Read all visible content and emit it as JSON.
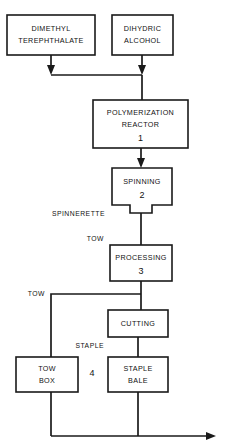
{
  "diagram": {
    "type": "process-flow-chart",
    "background_color": "#ffffff",
    "line_color": "#1a1a1a",
    "text_color": "#111111",
    "nodes": [
      {
        "id": "dimethyl-terephthalate",
        "shape": "rect",
        "line1": "DIMETHYL",
        "line2": "TEREPHTHALATE",
        "number": "",
        "x": 7,
        "y": 15,
        "w": 88,
        "h": 40
      },
      {
        "id": "dihydric-alcohol",
        "shape": "rect",
        "line1": "DIHYDRIC",
        "line2": "ALCOHOL",
        "number": "",
        "x": 112,
        "y": 15,
        "w": 61,
        "h": 40
      },
      {
        "id": "polymerization-reactor",
        "shape": "rect",
        "line1": "POLYMERIZATION",
        "line2": "REACTOR",
        "number": "1",
        "x": 93,
        "y": 100,
        "w": 95,
        "h": 48
      },
      {
        "id": "spinning",
        "shape": "rect-with-spinnerette-tab",
        "line1": "SPINNING",
        "line2": "",
        "number": "2",
        "x": 112,
        "y": 168,
        "w": 60,
        "h": 37
      },
      {
        "id": "processing",
        "shape": "rect",
        "line1": "PROCESSING",
        "line2": "",
        "number": "3",
        "x": 110,
        "y": 245,
        "w": 62,
        "h": 36
      },
      {
        "id": "cutting",
        "shape": "rect",
        "line1": "CUTTING",
        "line2": "",
        "number": "",
        "x": 108,
        "y": 310,
        "w": 60,
        "h": 27
      },
      {
        "id": "tow-box",
        "shape": "rect",
        "line1": "TOW",
        "line2": "BOX",
        "number": "",
        "x": 16,
        "y": 357,
        "w": 62,
        "h": 35
      },
      {
        "id": "staple-bale",
        "shape": "rect",
        "line1": "STAPLE",
        "line2": "BALE",
        "number": "",
        "x": 108,
        "y": 357,
        "w": 60,
        "h": 35
      }
    ],
    "edge_labels": [
      {
        "id": "spinnerette-label",
        "text": "SPINNERETTE",
        "x": 105,
        "y": 214,
        "anchor": "end"
      },
      {
        "id": "tow-label-upper",
        "text": "TOW",
        "x": 104,
        "y": 239,
        "anchor": "end"
      },
      {
        "id": "tow-label-lower",
        "text": "TOW",
        "x": 45,
        "y": 294,
        "anchor": "end"
      },
      {
        "id": "staple-label",
        "text": "STAPLE",
        "x": 104,
        "y": 346,
        "anchor": "end"
      }
    ],
    "group_number": {
      "id": "group-4",
      "text": "4",
      "x": 92,
      "y": 374
    }
  }
}
